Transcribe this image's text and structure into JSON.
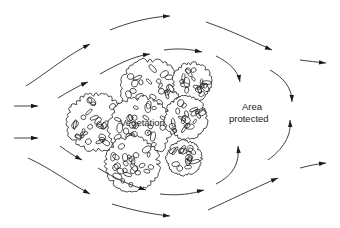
{
  "labels": {
    "vegetation": "Vegetation",
    "area_line1": "Area",
    "area_line2": "protected"
  },
  "colors": {
    "ink": "#1a1a1a",
    "background": "#ffffff"
  },
  "flow_arrows": [
    {
      "id": "inlet-upper",
      "path": "M14,106 L38,106",
      "head": [
        38,
        106,
        0
      ]
    },
    {
      "id": "inlet-lower",
      "path": "M14,138 L38,138",
      "head": [
        38,
        138,
        0
      ]
    },
    {
      "id": "top-left-rise",
      "path": "M26,86 C48,72 66,56 90,44",
      "head": [
        90,
        44,
        -28
      ]
    },
    {
      "id": "top-arc",
      "path": "M110,30 C130,22 150,17 170,16",
      "head": [
        170,
        16,
        -3
      ]
    },
    {
      "id": "top-descend",
      "path": "M206,22 C230,30 250,40 272,50",
      "head": [
        272,
        50,
        22
      ]
    },
    {
      "id": "right-upper-exit",
      "path": "M300,60 C308,61 316,62 326,63",
      "head": [
        326,
        63,
        5
      ]
    },
    {
      "id": "mid-upper-rise",
      "path": "M58,98 C68,92 78,86 88,82",
      "head": [
        88,
        82,
        -22
      ]
    },
    {
      "id": "mid-upper-arc",
      "path": "M100,74 C118,64 134,56 150,54",
      "head": [
        150,
        54,
        -8
      ]
    },
    {
      "id": "canopy-top-over",
      "path": "M164,50 C178,48 190,49 202,52",
      "head": [
        202,
        52,
        10
      ]
    },
    {
      "id": "eddy-upper-a",
      "path": "M216,56 C228,62 238,70 240,82",
      "head": [
        240,
        82,
        80
      ]
    },
    {
      "id": "eddy-upper-b",
      "path": "M270,70 C284,78 292,88 292,102",
      "head": [
        292,
        102,
        88
      ]
    },
    {
      "id": "eddy-lower-b",
      "path": "M268,160 C282,150 292,136 290,120",
      "head": [
        290,
        120,
        -92
      ]
    },
    {
      "id": "eddy-lower-a",
      "path": "M216,184 C232,176 240,164 238,146",
      "head": [
        238,
        146,
        -95
      ]
    },
    {
      "id": "mid-lower-fall",
      "path": "M60,146 C68,152 74,156 82,160",
      "head": [
        82,
        160,
        28
      ]
    },
    {
      "id": "bottom-mid-arc",
      "path": "M98,168 C114,178 132,186 146,190",
      "head": [
        146,
        190,
        18
      ]
    },
    {
      "id": "canopy-bottom-under",
      "path": "M160,194 C178,196 192,194 204,190",
      "head": [
        204,
        190,
        -12
      ]
    },
    {
      "id": "bottom-left-fall",
      "path": "M28,158 C50,168 68,182 90,194",
      "head": [
        90,
        194,
        28
      ]
    },
    {
      "id": "bottom-arc",
      "path": "M112,204 C132,210 150,214 170,216",
      "head": [
        170,
        216,
        5
      ]
    },
    {
      "id": "bottom-rise",
      "path": "M208,210 C230,200 250,190 278,178",
      "head": [
        278,
        178,
        -22
      ]
    },
    {
      "id": "right-lower-exit",
      "path": "M300,168 C308,166 316,164 326,163",
      "head": [
        326,
        163,
        -6
      ]
    }
  ],
  "canopies": [
    {
      "id": "crown-left",
      "cx": 96,
      "cy": 122,
      "r": 30
    },
    {
      "id": "crown-top-center",
      "cx": 150,
      "cy": 88,
      "r": 30
    },
    {
      "id": "crown-top-right",
      "cx": 192,
      "cy": 82,
      "r": 20
    },
    {
      "id": "crown-center",
      "cx": 140,
      "cy": 128,
      "r": 32
    },
    {
      "id": "crown-mid-right",
      "cx": 186,
      "cy": 118,
      "r": 22
    },
    {
      "id": "crown-bottom-center",
      "cx": 132,
      "cy": 164,
      "r": 28
    },
    {
      "id": "crown-bottom-right",
      "cx": 184,
      "cy": 158,
      "r": 18
    }
  ]
}
